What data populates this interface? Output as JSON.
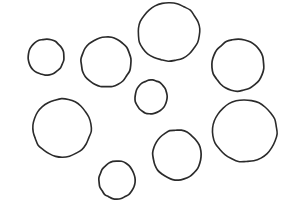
{
  "scene": {
    "title": "Hand-drawn circle outlines",
    "description": "Nine irregular hand-drawn circle outlines of varying size scattered on a plain white background",
    "width": 294,
    "height": 215,
    "background_color": "#ffffff",
    "stroke_color": "#2b2b2b",
    "stroke_width": 1.6,
    "shape_count": 9,
    "shape_kind": "circle"
  },
  "shapes": [
    {
      "id": "circle-1",
      "label": "small circle upper left",
      "cx": 46,
      "cy": 57,
      "rx": 18,
      "ry": 18,
      "rotate": -4,
      "size_class": "small",
      "stroke_color": "#2b2b2b",
      "stroke_width": 1.7
    },
    {
      "id": "circle-2",
      "label": "medium circle upper left-center",
      "cx": 106,
      "cy": 62,
      "rx": 25,
      "ry": 25,
      "rotate": 6,
      "size_class": "medium",
      "stroke_color": "#2b2b2b",
      "stroke_width": 1.7
    },
    {
      "id": "circle-3",
      "label": "large circle top center",
      "cx": 169,
      "cy": 32,
      "rx": 31,
      "ry": 29,
      "rotate": -6,
      "size_class": "large",
      "stroke_color": "#2b2b2b",
      "stroke_width": 1.6
    },
    {
      "id": "circle-4",
      "label": "medium circle upper right",
      "cx": 238,
      "cy": 65,
      "rx": 26,
      "ry": 26,
      "rotate": 8,
      "size_class": "medium",
      "stroke_color": "#2b2b2b",
      "stroke_width": 1.7
    },
    {
      "id": "circle-5",
      "label": "small circle center",
      "cx": 151,
      "cy": 97,
      "rx": 16,
      "ry": 17,
      "rotate": 12,
      "size_class": "small",
      "stroke_color": "#2b2b2b",
      "stroke_width": 1.7
    },
    {
      "id": "circle-6",
      "label": "large circle middle left",
      "cx": 62,
      "cy": 128,
      "rx": 29,
      "ry": 29,
      "rotate": -8,
      "size_class": "large",
      "stroke_color": "#2b2b2b",
      "stroke_width": 1.6
    },
    {
      "id": "circle-7",
      "label": "large circle middle right",
      "cx": 245,
      "cy": 131,
      "rx": 32,
      "ry": 31,
      "rotate": 5,
      "size_class": "large",
      "stroke_color": "#2b2b2b",
      "stroke_width": 1.6
    },
    {
      "id": "circle-8",
      "label": "medium circle lower center",
      "cx": 177,
      "cy": 155,
      "rx": 24,
      "ry": 25,
      "rotate": -10,
      "size_class": "medium",
      "stroke_color": "#2b2b2b",
      "stroke_width": 1.7
    },
    {
      "id": "circle-9",
      "label": "small circle bottom left-center",
      "cx": 117,
      "cy": 180,
      "rx": 18,
      "ry": 19,
      "rotate": 7,
      "size_class": "small",
      "stroke_color": "#2b2b2b",
      "stroke_width": 1.7
    }
  ]
}
